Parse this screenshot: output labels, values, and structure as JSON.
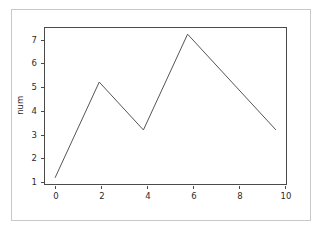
{
  "chart_data": {
    "type": "line",
    "title": "",
    "subtitle": "",
    "xlabel": "",
    "ylabel": "num",
    "x": [
      0,
      2,
      4,
      6,
      10
    ],
    "values": [
      1,
      5,
      3,
      7,
      3
    ],
    "series": [
      {
        "name": "num",
        "x": [
          0,
          2,
          4,
          6,
          10
        ],
        "values": [
          1,
          5,
          3,
          7,
          3
        ]
      }
    ],
    "xlim": [
      -0.5,
      10.5
    ],
    "ylim": [
      0.7,
      7.3
    ],
    "xticks": [
      0,
      2,
      4,
      6,
      8,
      10
    ],
    "yticks": [
      1,
      2,
      3,
      4,
      5,
      6,
      7
    ],
    "xtick_labels": [
      "0",
      "2",
      "4",
      "6",
      "8",
      "10"
    ],
    "ytick_labels": [
      "1",
      "2",
      "3",
      "4",
      "5",
      "6",
      "7"
    ],
    "grid": false,
    "legend": false,
    "legend_position": "none",
    "annotations": [],
    "line_color": "#555555",
    "line_width": 1,
    "marker": "none",
    "background_color": "#ffffff",
    "axes_edge_color": "#4a4a4a",
    "figure_border_color": "#c9c9c9",
    "tick_label_color": "#2b2b2b"
  }
}
